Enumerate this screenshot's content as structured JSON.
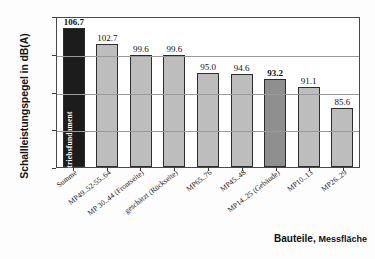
{
  "chart_data": {
    "type": "bar",
    "title": "",
    "xlabel": "Bauteile, Messfläche",
    "ylabel": "Schallleistungspegel in dB(A)",
    "ylim": [
      70,
      110
    ],
    "yticks": [
      110,
      100,
      90,
      80,
      70
    ],
    "grid": "horizontal",
    "legend": "none",
    "categories": [
      "Summe",
      "MP49..52-55..64",
      "MP 30..44 (Frontseite)",
      "geschätzt (Rückseite)",
      "MP65..76",
      "MP45..48",
      "MP14..25 (Gebäude)",
      "MP10..13",
      "MP26..29"
    ],
    "values": [
      106.7,
      102.7,
      99.6,
      99.6,
      95.0,
      94.6,
      93.2,
      91.1,
      85.6
    ],
    "value_labels": [
      "106.7",
      "102.7",
      "99.6",
      "99.6",
      "95.0",
      "94.6",
      "93.2",
      "91.1",
      "85.6"
    ],
    "bar_colors": [
      "#1c1c1c",
      "#bdbdbd",
      "#bdbdbd",
      "#bdbdbd",
      "#bdbdbd",
      "#bdbdbd",
      "#8f8f8f",
      "#bdbdbd",
      "#bdbdbd"
    ],
    "label_bold": [
      true,
      false,
      false,
      false,
      false,
      false,
      true,
      false,
      false
    ],
    "annotations": [
      {
        "text": "L WA = Antriebsfundament",
        "target_category": "Summe",
        "orientation": "vertical",
        "color": "#ffffff"
      }
    ]
  },
  "axis_title_x_main": "Bauteile,",
  "axis_title_x_sub": "Messfläche"
}
